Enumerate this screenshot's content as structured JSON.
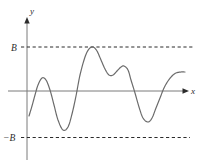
{
  "figure": {
    "type": "math-graph",
    "background_color": "#ffffff",
    "axis_color": "#7a7a7a",
    "curve_color": "#6b6b6b",
    "dash_color": "#2b2b2b",
    "label_color": "#2b2b2b",
    "labels": {
      "y_axis": "y",
      "x_axis": "x",
      "upper_bound": "B",
      "lower_bound": "−B"
    }
  },
  "chart_data": {
    "type": "line",
    "title": "",
    "xlabel": "x",
    "ylabel": "y",
    "grid": false,
    "legend": null,
    "axis_origin_px": {
      "x": 27,
      "y": 91
    },
    "xlim_px": [
      27,
      188
    ],
    "ylim_px": [
      18,
      160
    ],
    "annotations": [
      {
        "text": "B",
        "type": "bound-label",
        "x_px": 13,
        "y_px": 50
      },
      {
        "text": "−B",
        "type": "bound-label",
        "x_px": 3,
        "y_px": 141
      },
      {
        "text": "y",
        "type": "axis-label",
        "x_px": 30,
        "y_px": 14
      },
      {
        "text": "x",
        "type": "axis-label",
        "x_px": 191,
        "y_px": 94
      }
    ],
    "reference_lines": [
      {
        "name": "upper-bound",
        "label": "B",
        "y_px": 47,
        "x_start_px": 21,
        "x_end_px": 193,
        "style": "dashed"
      },
      {
        "name": "lower-bound",
        "label": "−B",
        "y_px": 137,
        "x_start_px": 21,
        "x_end_px": 190,
        "style": "dashed"
      }
    ],
    "series": [
      {
        "name": "f(x)",
        "description": "Oscillating bounded function whose maximum touches the line y = B and whose minima stay above y = -B",
        "points_px": [
          [
            29,
            116
          ],
          [
            32,
            106
          ],
          [
            35,
            95
          ],
          [
            38,
            85
          ],
          [
            42,
            78
          ],
          [
            46,
            80
          ],
          [
            50,
            90
          ],
          [
            54,
            105
          ],
          [
            58,
            120
          ],
          [
            63,
            130
          ],
          [
            68,
            127
          ],
          [
            72,
            114
          ],
          [
            76,
            96
          ],
          [
            80,
            75
          ],
          [
            85,
            57
          ],
          [
            89,
            49
          ],
          [
            93,
            47
          ],
          [
            97,
            51
          ],
          [
            101,
            60
          ],
          [
            105,
            69
          ],
          [
            109,
            75
          ],
          [
            113,
            75
          ],
          [
            117,
            71
          ],
          [
            121,
            67
          ],
          [
            124,
            66
          ],
          [
            128,
            70
          ],
          [
            131,
            80
          ],
          [
            135,
            93
          ],
          [
            139,
            107
          ],
          [
            143,
            118
          ],
          [
            148,
            122
          ],
          [
            152,
            118
          ],
          [
            156,
            108
          ],
          [
            160,
            98
          ],
          [
            164,
            88
          ],
          [
            168,
            81
          ],
          [
            172,
            76
          ],
          [
            176,
            73
          ],
          [
            181,
            72
          ],
          [
            185,
            72
          ]
        ]
      }
    ]
  }
}
